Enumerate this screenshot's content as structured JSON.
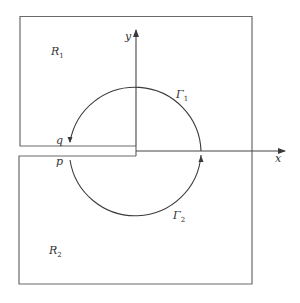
{
  "colors": {
    "background": "#ffffff",
    "stroke": "#555555",
    "curve": "#3a3a3a",
    "text": "#333333"
  },
  "axes": {
    "x_label": "x",
    "y_label": "y"
  },
  "regions": {
    "upper": {
      "name": "R",
      "subscript": "1"
    },
    "lower": {
      "name": "R",
      "subscript": "2"
    }
  },
  "contours": {
    "upper": {
      "name": "Γ",
      "subscript": "1"
    },
    "lower": {
      "name": "Γ",
      "subscript": "2"
    }
  },
  "points": {
    "q": "q",
    "p": "p"
  }
}
